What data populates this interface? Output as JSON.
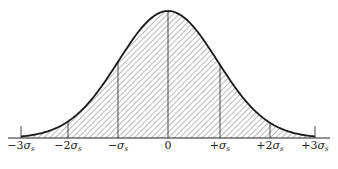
{
  "figure": {
    "title": "",
    "curve_color": "#1a1a1a",
    "hatch_color": "#555555"
  },
  "axis": {
    "ticks": [
      {
        "sign": "−",
        "coef": "3",
        "sym": "σ",
        "sub": "s",
        "x": 21
      },
      {
        "sign": "−",
        "coef": "2",
        "sym": "σ",
        "sub": "s",
        "x": 68
      },
      {
        "sign": "−",
        "coef": "",
        "sym": "σ",
        "sub": "s",
        "x": 118
      },
      {
        "sign": "",
        "coef": "0",
        "sym": "",
        "sub": "",
        "x": 168
      },
      {
        "sign": "+",
        "coef": "",
        "sym": "σ",
        "sub": "s",
        "x": 220
      },
      {
        "sign": "+",
        "coef": "2",
        "sym": "σ",
        "sub": "s",
        "x": 270
      },
      {
        "sign": "+",
        "coef": "3",
        "sym": "σ",
        "sub": "s",
        "x": 315
      }
    ],
    "labels": [
      "−3σs",
      "−2σs",
      "−σs",
      "0",
      "+σs",
      "+2σs",
      "+3σs"
    ]
  }
}
